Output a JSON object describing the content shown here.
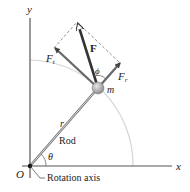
{
  "diagram": {
    "type": "vector-decomposition",
    "labels": {
      "y_axis": "y",
      "x_axis": "x",
      "origin": "O",
      "force": "F",
      "force_tangential": "F",
      "force_tangential_sub": "t",
      "force_radial": "F",
      "force_radial_sub": "r",
      "angle_phi": "ϕ",
      "angle_theta": "θ",
      "mass": "m",
      "radius": "r",
      "rod": "Rod",
      "rotation_axis": "Rotation axis"
    },
    "colors": {
      "axis": "#555555",
      "vector": "#444444",
      "dashed": "#888888",
      "arc": "#cccccc",
      "mass": "#9a9a9a",
      "rod": "#777777",
      "text": "#222222"
    }
  }
}
